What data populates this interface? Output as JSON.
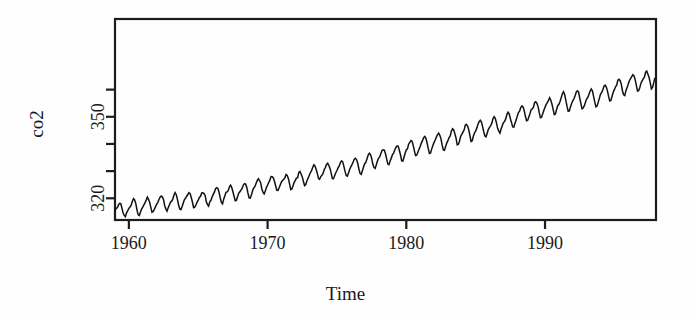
{
  "figure": {
    "background_color": "#fefefe",
    "ink_color": "#1a1a1a",
    "line_color": "#111111"
  },
  "chart_data": {
    "type": "line",
    "title": "",
    "subtitle": "",
    "xlabel": "Time",
    "ylabel": "co2",
    "xlim": [
      1959.0,
      1998.0
    ],
    "ylim": [
      312.0,
      386.0
    ],
    "xticks": [
      1960,
      1970,
      1980,
      1990
    ],
    "xtick_labels": [
      "1960",
      "1970",
      "1980",
      "1990"
    ],
    "yticks": [
      320,
      330,
      340,
      350,
      360
    ],
    "ytick_labels": [
      "320",
      "",
      "",
      "350",
      ""
    ],
    "grid": false,
    "legend": "none",
    "annotations": [],
    "series": [
      {
        "name": "co2",
        "description": "Monthly atmospheric CO2 concentration, Mauna Loa Observatory, parts per million (1959-1997)",
        "x_start": 1959.0,
        "x_step": 0.0833333,
        "units": "ppm",
        "values": [
          315.42,
          316.31,
          316.5,
          317.56,
          318.13,
          318.0,
          316.39,
          314.65,
          313.68,
          313.18,
          314.66,
          315.43,
          316.27,
          316.81,
          317.42,
          318.87,
          319.87,
          319.43,
          318.01,
          315.74,
          314.0,
          313.68,
          314.84,
          316.03,
          316.73,
          317.54,
          318.38,
          319.31,
          320.42,
          319.61,
          318.42,
          316.63,
          314.83,
          315.16,
          315.94,
          316.85,
          317.78,
          318.4,
          319.53,
          320.42,
          320.85,
          320.45,
          319.45,
          317.25,
          316.11,
          315.27,
          316.53,
          317.53,
          318.58,
          318.92,
          319.7,
          321.22,
          322.08,
          321.31,
          319.58,
          317.61,
          316.05,
          315.83,
          316.91,
          318.2,
          319.41,
          320.07,
          320.74,
          321.4,
          322.06,
          321.73,
          320.27,
          318.54,
          316.54,
          316.71,
          317.53,
          318.55,
          319.27,
          320.28,
          320.73,
          321.97,
          322.0,
          321.71,
          321.05,
          318.71,
          317.66,
          317.14,
          318.7,
          319.25,
          320.46,
          321.43,
          322.23,
          323.54,
          323.91,
          323.59,
          322.24,
          320.2,
          318.48,
          317.94,
          319.63,
          320.87,
          322.17,
          322.34,
          322.88,
          324.25,
          324.83,
          323.93,
          322.38,
          320.76,
          319.1,
          319.24,
          320.56,
          321.8,
          322.4,
          322.99,
          323.73,
          324.86,
          325.4,
          325.2,
          323.98,
          321.95,
          320.18,
          320.09,
          321.16,
          322.74,
          323.83,
          324.26,
          325.47,
          326.5,
          327.21,
          326.54,
          325.72,
          323.5,
          322.22,
          321.62,
          322.69,
          323.95,
          324.89,
          325.82,
          326.77,
          327.97,
          327.91,
          327.5,
          326.18,
          324.53,
          322.93,
          322.9,
          323.85,
          324.96,
          326.01,
          326.51,
          327.01,
          327.62,
          328.76,
          328.4,
          327.2,
          325.27,
          323.2,
          323.4,
          324.63,
          325.85,
          326.6,
          327.47,
          327.58,
          329.56,
          329.9,
          328.92,
          327.88,
          326.16,
          324.68,
          325.04,
          326.34,
          327.39,
          328.37,
          329.4,
          330.14,
          331.33,
          332.31,
          331.9,
          330.7,
          329.15,
          327.35,
          327.02,
          327.99,
          328.48,
          329.18,
          330.55,
          331.32,
          332.48,
          332.92,
          332.08,
          331.01,
          329.23,
          327.27,
          327.21,
          328.29,
          329.41,
          330.23,
          331.25,
          331.87,
          333.14,
          333.8,
          333.43,
          331.73,
          329.9,
          328.4,
          328.17,
          329.32,
          330.59,
          331.58,
          332.39,
          333.33,
          334.41,
          334.71,
          334.17,
          332.89,
          330.77,
          329.14,
          328.78,
          330.14,
          331.52,
          332.75,
          333.24,
          334.53,
          335.9,
          336.57,
          336.1,
          334.76,
          332.59,
          331.42,
          330.98,
          332.24,
          333.68,
          334.8,
          335.22,
          336.47,
          337.59,
          337.84,
          337.72,
          336.37,
          334.51,
          332.6,
          332.38,
          333.75,
          334.78,
          336.05,
          336.59,
          337.79,
          338.71,
          339.3,
          339.12,
          337.56,
          335.92,
          333.75,
          333.7,
          335.12,
          336.56,
          337.84,
          338.19,
          339.91,
          340.6,
          341.29,
          341.0,
          339.39,
          337.43,
          335.72,
          335.84,
          336.93,
          338.04,
          339.06,
          340.3,
          341.21,
          342.33,
          342.74,
          342.08,
          340.32,
          338.26,
          336.52,
          336.68,
          338.19,
          339.44,
          340.57,
          341.44,
          342.53,
          343.39,
          343.96,
          343.18,
          341.88,
          339.65,
          337.81,
          337.69,
          339.09,
          340.32,
          341.2,
          342.35,
          342.93,
          344.77,
          345.58,
          345.14,
          343.81,
          342.21,
          339.69,
          339.82,
          340.98,
          342.82,
          343.52,
          344.33,
          345.11,
          346.88,
          347.25,
          346.62,
          345.22,
          343.11,
          340.9,
          341.18,
          342.8,
          344.04,
          344.79,
          345.82,
          347.25,
          348.17,
          348.74,
          348.07,
          346.38,
          344.51,
          342.92,
          342.62,
          344.06,
          345.38,
          346.11,
          346.78,
          347.68,
          349.37,
          350.03,
          349.37,
          347.76,
          345.73,
          344.68,
          343.99,
          345.48,
          346.72,
          347.84,
          348.29,
          349.23,
          350.8,
          351.66,
          351.07,
          349.33,
          347.92,
          346.27,
          346.18,
          347.64,
          348.78,
          350.25,
          351.54,
          352.05,
          353.41,
          354.04,
          353.62,
          352.22,
          350.27,
          348.55,
          348.72,
          349.91,
          351.18,
          352.6,
          352.92,
          353.53,
          355.26,
          355.52,
          354.97,
          353.75,
          351.52,
          349.64,
          349.83,
          351.14,
          352.37,
          353.5,
          354.55,
          355.23,
          356.04,
          357.0,
          356.07,
          354.67,
          352.76,
          350.82,
          351.04,
          352.69,
          354.07,
          354.59,
          355.63,
          357.03,
          358.48,
          359.22,
          358.12,
          356.06,
          353.92,
          352.05,
          352.11,
          353.64,
          354.89,
          355.88,
          356.63,
          357.72,
          359.07,
          359.58,
          359.17,
          356.94,
          354.92,
          352.94,
          353.23,
          354.09,
          355.33,
          356.63,
          357.1,
          358.32,
          359.41,
          360.23,
          359.55,
          357.53,
          355.48,
          353.67,
          353.95,
          355.3,
          356.78,
          358.34,
          358.89,
          359.95,
          361.25,
          361.67,
          360.94,
          359.55,
          357.49,
          355.84,
          356.0,
          357.59,
          359.05,
          359.98,
          361.03,
          361.66,
          363.48,
          363.82,
          363.3,
          361.94,
          359.5,
          358.11,
          357.8,
          359.61,
          360.74,
          362.09,
          363.29,
          364.06,
          364.76,
          365.45,
          365.01,
          363.7,
          361.54,
          359.51,
          359.65,
          360.8,
          362.38,
          363.23,
          364.06,
          364.61,
          366.4,
          366.84,
          365.68,
          364.52,
          362.57,
          360.24,
          360.83,
          362.49,
          364.34
        ]
      }
    ]
  },
  "axes": {
    "plot_box": {
      "left": 115,
      "top": 19,
      "right": 656,
      "bottom": 220
    }
  }
}
